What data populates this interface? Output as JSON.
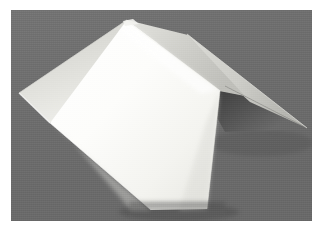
{
  "image": {
    "subject": "folded-paper-sheet",
    "description": "A sheet of white paper folded into a W / zig-zag shape standing on a flat gray surface, photographed against a gray backdrop",
    "width_px": 323,
    "height_px": 232,
    "border": {
      "style": "white-photo-margin",
      "color": "#ffffff",
      "left_px": 11,
      "top_px": 10,
      "right_px": 11,
      "bottom_px": 11
    },
    "canvas": {
      "width_px": 301,
      "height_px": 211
    }
  },
  "palette": {
    "background_gray": "#6e6e6e",
    "background_gray_dark": "#5f5f5f",
    "background_gray_light": "#787878",
    "paper_white": "#ffffff",
    "paper_bright": "#fbfbf8",
    "paper_midtone": "#d8d8d4",
    "paper_shade": "#c4c4c0",
    "paper_shadow": "#a8a8a4",
    "crease_line": "#bdbdb8",
    "cast_shadow": "#4a4a4a",
    "frame_white": "#ffffff"
  },
  "geometry": {
    "note": "Polygon vertex coordinates are given in the 301x211 photo-canvas coordinate space",
    "apex_top": [
      117,
      10
    ],
    "left_tip": [
      9,
      83
    ],
    "right_tip": [
      294,
      118
    ],
    "bottom_left": [
      141,
      199
    ],
    "bottom_right": [
      195,
      198
    ],
    "faces": [
      {
        "name": "left-outer-flap",
        "tone": "paper_midtone",
        "points": "9,83 117,10 147,33 40,112"
      },
      {
        "name": "front-main-panel",
        "tone": "paper_white",
        "points": "117,10 210,82 195,198 141,199 40,112"
      },
      {
        "name": "ridge-right-panel",
        "tone": "paper_shade",
        "points": "117,10 178,26 232,83 210,82"
      },
      {
        "name": "right-outer-flap",
        "tone": "paper_shade",
        "points": "178,26 294,118 232,87"
      },
      {
        "name": "under-shadow-wedge",
        "tone": "cast_shadow",
        "points": "210,82 232,85 294,118 218,120"
      }
    ],
    "creases": [
      {
        "name": "ridge-crease-top",
        "from": [
          117,
          10
        ],
        "to": [
          210,
          82
        ]
      },
      {
        "name": "valley-crease-left",
        "from": [
          9,
          83
        ],
        "to": [
          40,
          112
        ]
      },
      {
        "name": "front-edge-left",
        "from": [
          40,
          112
        ],
        "to": [
          141,
          199
        ]
      },
      {
        "name": "front-edge-right",
        "from": [
          210,
          82
        ],
        "to": [
          195,
          198
        ]
      }
    ]
  },
  "lighting": {
    "key_light_direction": "upper-left",
    "brightest_region": "front-main-panel",
    "darkest_paper_region": "under-shadow-wedge"
  },
  "labels": {
    "alt_text": "Photograph of a zig-zag folded white paper sheet on a gray background",
    "title": ""
  }
}
